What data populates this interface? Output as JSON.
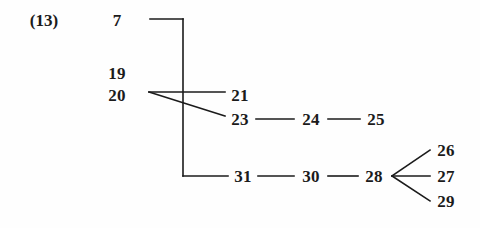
{
  "figure": {
    "tag": "(13)",
    "tag_x": 44,
    "tag_y": 20
  },
  "nodes": [
    {
      "id": "n7",
      "label": "7",
      "x": 117,
      "y": 20
    },
    {
      "id": "n19",
      "label": "19",
      "x": 117,
      "y": 73
    },
    {
      "id": "n20",
      "label": "20",
      "x": 117,
      "y": 95
    },
    {
      "id": "n21",
      "label": "21",
      "x": 240,
      "y": 95
    },
    {
      "id": "n23",
      "label": "23",
      "x": 240,
      "y": 119
    },
    {
      "id": "n24",
      "label": "24",
      "x": 311,
      "y": 119
    },
    {
      "id": "n25",
      "label": "25",
      "x": 376,
      "y": 119
    },
    {
      "id": "n31",
      "label": "31",
      "x": 243,
      "y": 176
    },
    {
      "id": "n30",
      "label": "30",
      "x": 311,
      "y": 176
    },
    {
      "id": "n28",
      "label": "28",
      "x": 374,
      "y": 176
    },
    {
      "id": "n26",
      "label": "26",
      "x": 446,
      "y": 150
    },
    {
      "id": "n27",
      "label": "27",
      "x": 446,
      "y": 176
    },
    {
      "id": "n29",
      "label": "29",
      "x": 446,
      "y": 201
    }
  ],
  "edges": [
    {
      "id": "e-bracket-top",
      "kind": "polyline",
      "points": "150,19 183,19"
    },
    {
      "id": "e-bracket-spine",
      "kind": "polyline",
      "points": "183,19 183,176"
    },
    {
      "id": "e-bracket-bottom",
      "kind": "polyline",
      "points": "183,176 228,176"
    },
    {
      "id": "e-fan-to-21",
      "kind": "line",
      "x1": 149,
      "y1": 92,
      "x2": 225,
      "y2": 92
    },
    {
      "id": "e-fan-to-23",
      "kind": "line",
      "x1": 149,
      "y1": 92,
      "x2": 225,
      "y2": 116
    },
    {
      "id": "e-31-30",
      "kind": "line",
      "x1": 258,
      "y1": 176,
      "x2": 294,
      "y2": 176
    },
    {
      "id": "e-30-28",
      "kind": "line",
      "x1": 328,
      "y1": 176,
      "x2": 358,
      "y2": 176
    },
    {
      "id": "e-23-24",
      "kind": "line",
      "x1": 256,
      "y1": 119,
      "x2": 294,
      "y2": 119
    },
    {
      "id": "e-24-25",
      "kind": "line",
      "x1": 328,
      "y1": 119,
      "x2": 360,
      "y2": 119
    },
    {
      "id": "e-28-26",
      "kind": "line",
      "x1": 392,
      "y1": 176,
      "x2": 430,
      "y2": 150
    },
    {
      "id": "e-28-27",
      "kind": "line",
      "x1": 392,
      "y1": 176,
      "x2": 430,
      "y2": 176
    },
    {
      "id": "e-28-29",
      "kind": "line",
      "x1": 392,
      "y1": 176,
      "x2": 430,
      "y2": 201
    }
  ],
  "style": {
    "ink": "#1b1b1b",
    "background": "#fefefe",
    "stroke_width": 1.6
  }
}
